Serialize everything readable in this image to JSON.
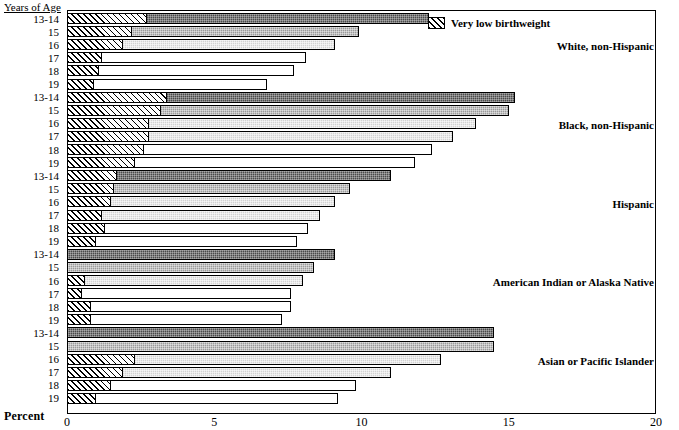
{
  "top_partial_title": "",
  "axis": {
    "y_title": "Years of Age",
    "x_title": "Percent",
    "x_ticks": [
      "0",
      "5",
      "10",
      "15",
      "20"
    ],
    "x_min": 0,
    "x_max": 20
  },
  "legend": {
    "items": [
      {
        "label": "Very low birthweight",
        "pattern": "diagonal-hatch"
      }
    ]
  },
  "chart_data": {
    "type": "bar",
    "orientation": "horizontal",
    "title": "",
    "xlabel": "Percent",
    "ylabel": "Years of Age",
    "xlim": [
      0,
      20
    ],
    "xticks": [
      0,
      5,
      10,
      15,
      20
    ],
    "grid": false,
    "legend_position": "top-center",
    "stacked": true,
    "series": [
      {
        "name": "Low birthweight (total)",
        "key": "total"
      },
      {
        "name": "Very low birthweight",
        "key": "vlbw"
      }
    ],
    "categories": [
      "13-14",
      "15",
      "16",
      "17",
      "18",
      "19"
    ],
    "groups": [
      {
        "name": "White, non-Hispanic",
        "fill": "dark",
        "rows": [
          {
            "age": "13-14",
            "total": 12.3,
            "vlbw": 2.7,
            "fill": "dark"
          },
          {
            "age": "15",
            "total": 9.9,
            "vlbw": 2.2,
            "fill": "mid"
          },
          {
            "age": "16",
            "total": 9.1,
            "vlbw": 1.9,
            "fill": "light"
          },
          {
            "age": "17",
            "total": 8.1,
            "vlbw": 1.2,
            "fill": "white"
          },
          {
            "age": "18",
            "total": 7.7,
            "vlbw": 1.1,
            "fill": "white"
          },
          {
            "age": "19",
            "total": 6.8,
            "vlbw": 0.9,
            "fill": "white"
          }
        ]
      },
      {
        "name": "Black, non-Hispanic",
        "fill": "dark",
        "rows": [
          {
            "age": "13-14",
            "total": 15.2,
            "vlbw": 3.4,
            "fill": "dark"
          },
          {
            "age": "15",
            "total": 15.0,
            "vlbw": 3.2,
            "fill": "mid"
          },
          {
            "age": "16",
            "total": 13.9,
            "vlbw": 2.8,
            "fill": "light"
          },
          {
            "age": "17",
            "total": 13.1,
            "vlbw": 2.8,
            "fill": "light"
          },
          {
            "age": "18",
            "total": 12.4,
            "vlbw": 2.6,
            "fill": "white"
          },
          {
            "age": "19",
            "total": 11.8,
            "vlbw": 2.3,
            "fill": "white"
          }
        ]
      },
      {
        "name": "Hispanic",
        "fill": "dark",
        "rows": [
          {
            "age": "13-14",
            "total": 11.0,
            "vlbw": 1.7,
            "fill": "dark"
          },
          {
            "age": "15",
            "total": 9.6,
            "vlbw": 1.6,
            "fill": "mid"
          },
          {
            "age": "16",
            "total": 9.1,
            "vlbw": 1.5,
            "fill": "light"
          },
          {
            "age": "17",
            "total": 8.6,
            "vlbw": 1.2,
            "fill": "light"
          },
          {
            "age": "18",
            "total": 8.2,
            "vlbw": 1.3,
            "fill": "white"
          },
          {
            "age": "19",
            "total": 7.8,
            "vlbw": 1.0,
            "fill": "white"
          }
        ]
      },
      {
        "name": "American Indian or Alaska Native",
        "fill": "dark",
        "rows": [
          {
            "age": "13-14",
            "total": 9.1,
            "vlbw": 0.0,
            "fill": "dark"
          },
          {
            "age": "15",
            "total": 8.4,
            "vlbw": 0.0,
            "fill": "mid"
          },
          {
            "age": "16",
            "total": 8.0,
            "vlbw": 0.6,
            "fill": "light"
          },
          {
            "age": "17",
            "total": 7.6,
            "vlbw": 0.5,
            "fill": "white"
          },
          {
            "age": "18",
            "total": 7.6,
            "vlbw": 0.8,
            "fill": "white"
          },
          {
            "age": "19",
            "total": 7.3,
            "vlbw": 0.8,
            "fill": "white"
          }
        ]
      },
      {
        "name": "Asian or Pacific Islander",
        "fill": "dark",
        "rows": [
          {
            "age": "13-14",
            "total": 14.5,
            "vlbw": 0.0,
            "fill": "dark"
          },
          {
            "age": "15",
            "total": 14.5,
            "vlbw": 0.0,
            "fill": "mid"
          },
          {
            "age": "16",
            "total": 12.7,
            "vlbw": 2.3,
            "fill": "light"
          },
          {
            "age": "17",
            "total": 11.0,
            "vlbw": 1.9,
            "fill": "light"
          },
          {
            "age": "18",
            "total": 9.8,
            "vlbw": 1.5,
            "fill": "white"
          },
          {
            "age": "19",
            "total": 9.2,
            "vlbw": 1.0,
            "fill": "white"
          }
        ]
      }
    ]
  }
}
